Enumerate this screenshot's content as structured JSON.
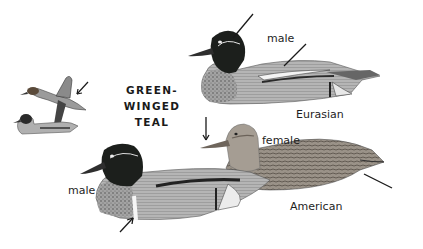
{
  "title": {
    "line1": "GREEN-WINGED",
    "line2": "TEAL"
  },
  "labels": {
    "eurasian_male": "male",
    "eurasian": "Eurasian",
    "female": "female",
    "american_male": "male",
    "american": "American"
  },
  "colors": {
    "background": "#ffffff",
    "head_dark": "#1c1f1c",
    "body_gray": "#a8a8a8",
    "breast_speckled": "#8a8a8a",
    "female_brown": "#8c8479",
    "arrow": "#1a1a1a"
  }
}
